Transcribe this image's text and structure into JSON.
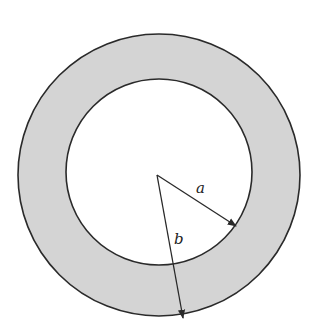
{
  "diagram": {
    "colors": {
      "ring_fill": "#d4d4d4",
      "stroke": "#2a2a2a",
      "background": "#ffffff"
    },
    "labels": {
      "inner_radius": "a",
      "outer_radius": "b"
    }
  }
}
